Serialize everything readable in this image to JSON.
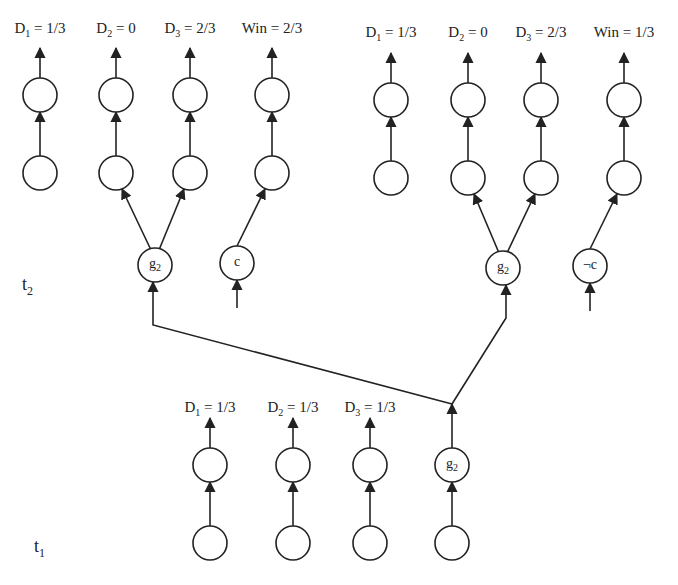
{
  "diagram": {
    "time_labels": {
      "t2": {
        "base": "t",
        "sub": "2"
      },
      "t1": {
        "base": "t",
        "sub": "1"
      }
    },
    "left_tree": {
      "outputs": [
        {
          "var": "D",
          "sub": "1",
          "value": "= 1/3"
        },
        {
          "var": "D",
          "sub": "2",
          "value": "= 0"
        },
        {
          "var": "D",
          "sub": "3",
          "value": "= 2/3"
        },
        {
          "var": "Win",
          "sub": "",
          "value": "= 2/3"
        }
      ],
      "gate_node": {
        "base": "g",
        "sub": "2"
      },
      "input_node": "c"
    },
    "right_tree": {
      "outputs": [
        {
          "var": "D",
          "sub": "1",
          "value": "= 1/3"
        },
        {
          "var": "D",
          "sub": "2",
          "value": "= 0"
        },
        {
          "var": "D",
          "sub": "3",
          "value": "= 2/3"
        },
        {
          "var": "Win",
          "sub": "",
          "value": "= 1/3"
        }
      ],
      "gate_node": {
        "base": "g",
        "sub": "2"
      },
      "input_node": "¬c"
    },
    "bottom_tree": {
      "outputs": [
        {
          "var": "D",
          "sub": "1",
          "value": "= 1/3"
        },
        {
          "var": "D",
          "sub": "2",
          "value": "= 1/3"
        },
        {
          "var": "D",
          "sub": "3",
          "value": "= 1/3"
        }
      ],
      "gate_node": {
        "base": "g",
        "sub": "2"
      }
    },
    "colors": {
      "stroke": "#222222",
      "background": "#ffffff"
    }
  }
}
